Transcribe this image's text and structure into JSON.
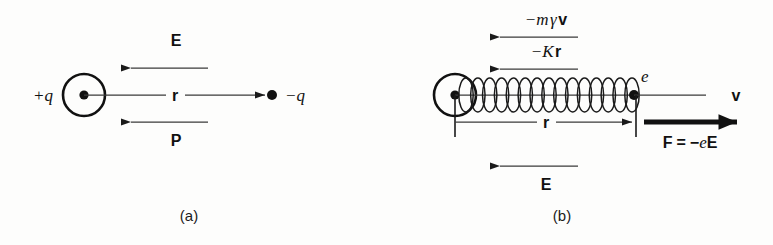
{
  "figure": {
    "background_color": "#fdfdfc",
    "ink_color": "#1a1a1a",
    "width": 773,
    "height": 245
  },
  "panel_a": {
    "caption": "(a)",
    "positive_charge_label": "+q",
    "negative_charge_label": "−q",
    "separation_label": "r",
    "field_label": "E",
    "polarization_label": "P",
    "nucleus_icon": "circled-dot-icon",
    "electron_icon": "filled-dot-icon"
  },
  "panel_b": {
    "caption": "(b)",
    "damping_force_label": "−mγv",
    "damping_force_parts": {
      "sign": "−",
      "mass": "m",
      "gamma": "γ",
      "velocity": "v"
    },
    "restoring_force_label": "−Kr",
    "restoring_force_parts": {
      "sign": "−",
      "spring_constant": "K",
      "displacement": "r"
    },
    "electron_label": "e",
    "velocity_label": "v",
    "displacement_label": "r",
    "field_label": "E",
    "driving_force_label": "F = −eE",
    "driving_force_parts": {
      "force": "F",
      "equals": "=",
      "sign": "−",
      "charge": "e",
      "field": "E"
    },
    "spring_icon": "coil-spring-icon",
    "nucleus_icon": "circled-dot-icon",
    "electron_icon": "filled-dot-icon",
    "spring_coil_count": 15
  }
}
